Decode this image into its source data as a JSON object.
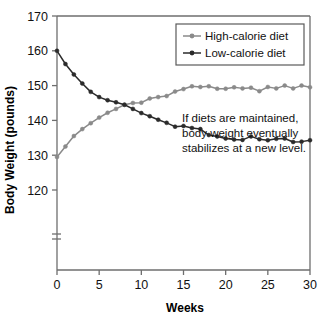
{
  "chart_data": {
    "type": "line",
    "title": "",
    "xlabel": "Weeks",
    "ylabel": "Body Weight (pounds)",
    "xlim": [
      0,
      30
    ],
    "ylim": [
      118,
      170
    ],
    "grid": false,
    "axis_break": true,
    "axis_break_label": "=",
    "legend_position": "top-right",
    "xticks": [
      0,
      5,
      10,
      15,
      20,
      25,
      30
    ],
    "yticks": [
      120,
      130,
      140,
      150,
      160,
      170
    ],
    "xtick_labels": [
      "0",
      "5",
      "10",
      "15",
      "20",
      "25",
      "30"
    ],
    "ytick_labels": [
      "120",
      "130",
      "140",
      "150",
      "160",
      "170"
    ],
    "x": [
      0,
      1,
      2,
      3,
      4,
      5,
      6,
      7,
      8,
      9,
      10,
      11,
      12,
      13,
      14,
      15,
      16,
      17,
      18,
      19,
      20,
      21,
      22,
      23,
      24,
      25,
      26,
      27,
      28,
      29,
      30
    ],
    "series": [
      {
        "name": "High-calorie diet",
        "color": "#8a8a8a",
        "marker": "circle",
        "values": [
          129.5,
          132.5,
          135.5,
          137.5,
          139.2,
          140.8,
          142.2,
          143.3,
          144.5,
          145.0,
          145.1,
          146.3,
          146.7,
          147.0,
          148.3,
          149.0,
          149.8,
          149.6,
          149.8,
          149.1,
          149.1,
          149.5,
          149.2,
          149.4,
          148.4,
          149.6,
          149.2,
          150.0,
          149.2,
          150.0,
          149.5
        ]
      },
      {
        "name": "Low-calorie diet",
        "color": "#2b2b2b",
        "marker": "circle",
        "values": [
          160.0,
          156.2,
          153.2,
          150.6,
          148.2,
          146.7,
          145.8,
          145.2,
          144.5,
          143.3,
          142.1,
          141.2,
          140.2,
          139.3,
          138.2,
          138.4,
          137.8,
          137.5,
          135.8,
          135.4,
          134.8,
          134.5,
          134.4,
          135.4,
          134.6,
          134.3,
          134.7,
          134.8,
          133.8,
          133.9,
          134.3
        ]
      }
    ],
    "annotations": [
      {
        "name": "stabilization-note",
        "lines": [
          "If diets are maintained,",
          "body weight eventually",
          "stabilizes at a new level."
        ]
      }
    ]
  }
}
